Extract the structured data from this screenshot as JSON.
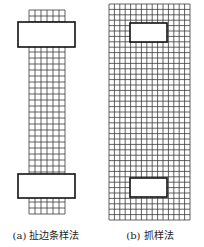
{
  "figure": {
    "panels": [
      {
        "id": "a",
        "caption": "(a) 扯边条样法",
        "grid": {
          "x": 29,
          "y": 10,
          "cols": 6,
          "rows": 34,
          "cell": 6
        },
        "clamps": [
          {
            "x": 18,
            "y": 22,
            "w": 57,
            "h": 25
          },
          {
            "x": 18,
            "y": 174,
            "w": 57,
            "h": 24
          }
        ],
        "caption_x": 46
      },
      {
        "id": "b",
        "caption": "(b) 抓样法",
        "grid": {
          "x": 109,
          "y": 4,
          "cols": 15,
          "rows": 40,
          "cell": 5.4
        },
        "clamps": [
          {
            "x": 130,
            "y": 23,
            "w": 37,
            "h": 19
          },
          {
            "x": 130,
            "y": 178,
            "w": 37,
            "h": 19
          }
        ],
        "caption_x": 150
      }
    ],
    "colors": {
      "grid_line": "#3a3a3a",
      "clamp_border": "#111111",
      "clamp_fill": "#ffffff",
      "background": "#ffffff"
    }
  }
}
